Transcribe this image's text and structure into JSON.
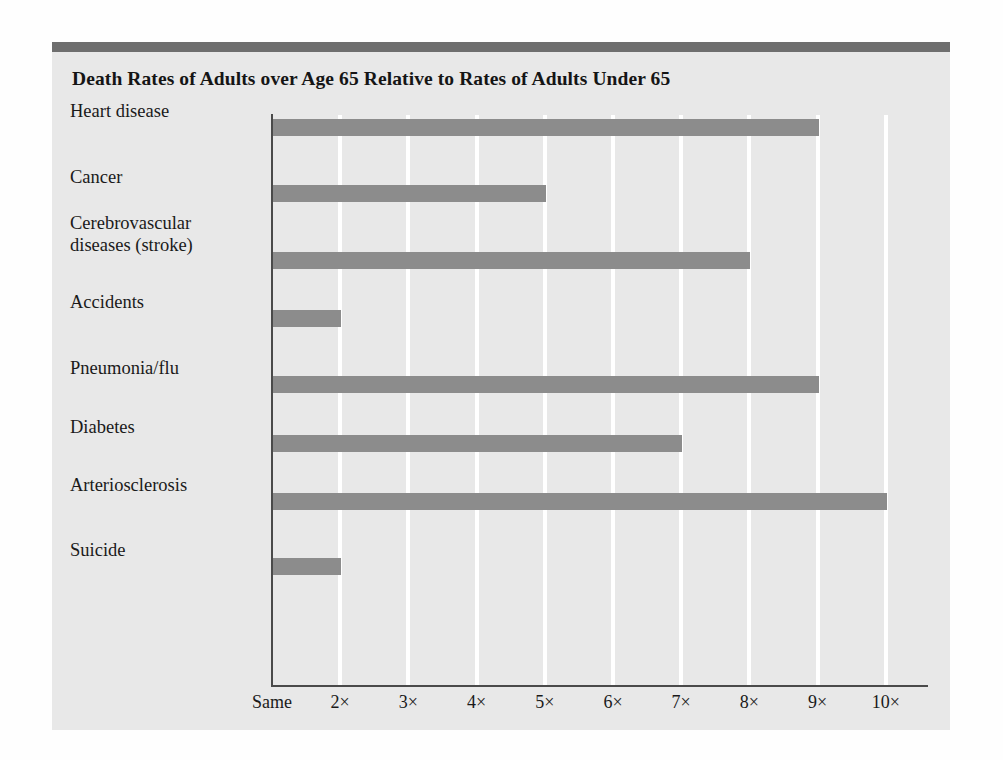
{
  "figure": {
    "title": "Death Rates of Adults over Age 65 Relative to Rates of Adults Under 65",
    "panel_background": "#e8e8e8",
    "top_rule_color": "#6e6e6e",
    "bar_color": "#8c8c8c",
    "axis_color": "#4a4a4a",
    "gridline_color": "#ffffff"
  },
  "chart_data": {
    "type": "bar",
    "orientation": "horizontal",
    "title": "Death Rates of Adults over Age 65 Relative to Rates of Adults Under 65",
    "xlabel": "",
    "ylabel": "",
    "categories": [
      "Heart disease",
      "Cerebrovascular diseases (stroke)",
      "Cancer",
      "Accidents",
      "Pneumonia/flu",
      "Diabetes",
      "Arteriosclerosis",
      "Suicide"
    ],
    "category_order": [
      "Heart disease",
      "Cancer",
      "Cerebrovascular diseases (stroke)",
      "Accidents",
      "Pneumonia/flu",
      "Diabetes",
      "Arteriosclerosis",
      "Suicide"
    ],
    "values": [
      9,
      5,
      8,
      2,
      9,
      7,
      10,
      2
    ],
    "bars": [
      {
        "label_line1": "Heart disease",
        "label_line2": "",
        "value": 9
      },
      {
        "label_line1": "Cancer",
        "label_line2": "",
        "value": 5
      },
      {
        "label_line1": "Cerebrovascular",
        "label_line2": "diseases (stroke)",
        "value": 8
      },
      {
        "label_line1": "Accidents",
        "label_line2": "",
        "value": 2
      },
      {
        "label_line1": "Pneumonia/flu",
        "label_line2": "",
        "value": 9
      },
      {
        "label_line1": "Diabetes",
        "label_line2": "",
        "value": 7
      },
      {
        "label_line1": "Arteriosclerosis",
        "label_line2": "",
        "value": 10
      },
      {
        "label_line1": "Suicide",
        "label_line2": "",
        "value": 2
      }
    ],
    "xlim": [
      1,
      10.2
    ],
    "xticks": [
      1,
      2,
      3,
      4,
      5,
      6,
      7,
      8,
      9,
      10
    ],
    "xticklabels": [
      "Same",
      "2×",
      "3×",
      "4×",
      "5×",
      "6×",
      "7×",
      "8×",
      "9×",
      "10×"
    ],
    "grid": true,
    "grid_axis": "x",
    "legend": null,
    "legend_position": "none",
    "units": "multiple of death rate for adults under 65"
  }
}
